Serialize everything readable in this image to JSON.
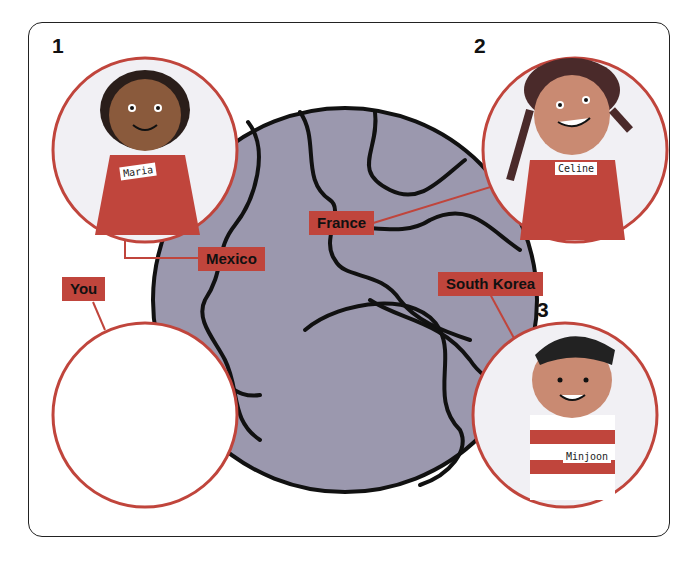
{
  "colors": {
    "globe": "#9B98AE",
    "land": "#8E8BA2",
    "label": "#C0453C",
    "circle_border": "#C0453C",
    "circle_bg": "#F1F0F4"
  },
  "children": [
    {
      "number": "1",
      "name": "Maria",
      "country": "Mexico"
    },
    {
      "number": "2",
      "name": "Celine",
      "country": "France"
    },
    {
      "number": "3",
      "name": "Minjoon",
      "country": "South Korea"
    }
  ],
  "you": {
    "label": "You"
  }
}
